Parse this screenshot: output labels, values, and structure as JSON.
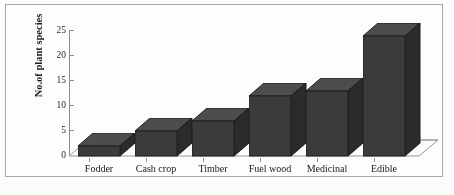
{
  "figure": {
    "background_color": "#fdfdfc",
    "frame_color": "#a8a8a8"
  },
  "chart_data": {
    "type": "bar",
    "title": "",
    "xlabel": "",
    "ylabel": "No.of plant species",
    "categories": [
      "Fodder",
      "Cash crop",
      "Timber",
      "Fuel wood",
      "Medicinal",
      "Edible"
    ],
    "values": [
      2,
      5,
      7,
      12,
      13,
      24
    ],
    "ylim": [
      0,
      25
    ],
    "yticks": [
      0,
      5,
      10,
      15,
      20,
      25
    ],
    "ytick_labels": [
      "0",
      "5",
      "10",
      "15",
      "20",
      "25"
    ],
    "grid": false,
    "legend": false,
    "style": "3d-bar",
    "bar_color": "#3a3a3a",
    "axis_color": "#8c8c8c"
  }
}
